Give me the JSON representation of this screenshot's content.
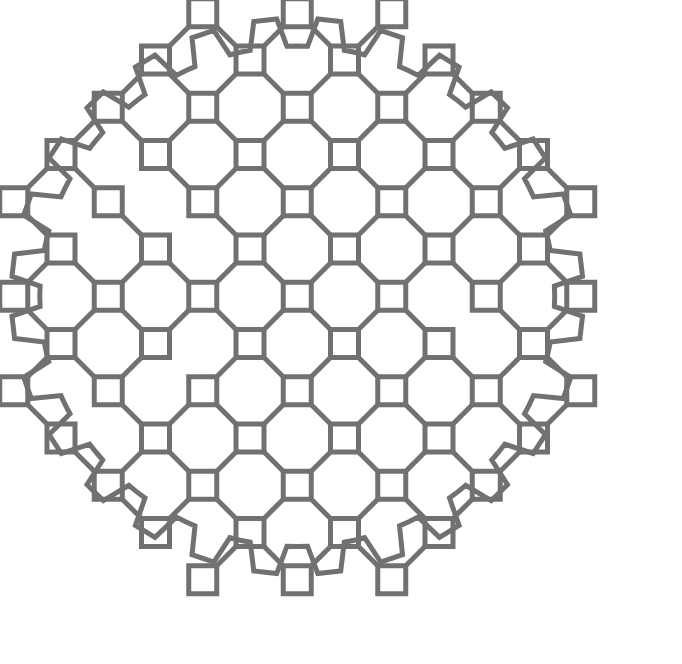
{
  "figure": {
    "name": "octagonal-lattice-pattern",
    "title": "Octagonal lattice ornament",
    "background_color": "#ffffff",
    "stroke_color": "#717171",
    "stroke_width": 5,
    "canvas": {
      "width": 682,
      "height": 664
    }
  },
  "geometry": {
    "origin_x": 61,
    "origin_y": 60,
    "cell": 94.5,
    "half_cell": 47.25,
    "square_size": 28,
    "square_half": 14,
    "diagonal_reach": 33,
    "columns": 6,
    "rows": 6,
    "radius_limit": 3.35,
    "center_col": 2.5,
    "center_row": 2.5
  },
  "chart_data": {
    "type": "scatter",
    "title": "Octagonal lattice ornament",
    "xlabel": "",
    "ylabel": "",
    "grid": false,
    "legend": false,
    "xlim": [
      0,
      682
    ],
    "ylim": [
      0,
      664
    ],
    "series": [
      {
        "name": "lattice-nodes",
        "marker": "open-square",
        "size": 28,
        "color": "#717171"
      },
      {
        "name": "diagonal-links",
        "marker": "line-45deg",
        "color": "#717171"
      },
      {
        "name": "scalloped-border",
        "marker": "polyline",
        "color": "#717171"
      }
    ]
  }
}
